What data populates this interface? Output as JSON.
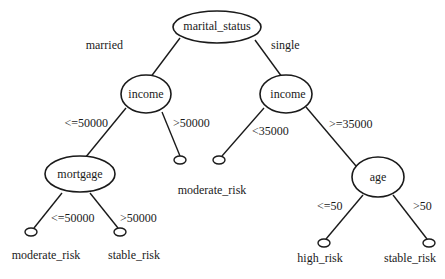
{
  "diagram": {
    "type": "decision-tree",
    "nodes": {
      "root": {
        "label": "marital_status"
      },
      "income_left": {
        "label": "income"
      },
      "income_right": {
        "label": "income"
      },
      "mortgage": {
        "label": "mortgage"
      },
      "age": {
        "label": "age"
      }
    },
    "edges": {
      "root_married": {
        "label": "married"
      },
      "root_single": {
        "label": "single"
      },
      "income_left_le50000": {
        "label": "<=50000"
      },
      "income_left_gt50000": {
        "label": ">50000"
      },
      "income_right_lt35000": {
        "label": "<35000"
      },
      "income_right_ge35000": {
        "label": ">=35000"
      },
      "mortgage_le50000": {
        "label": "<=50000"
      },
      "mortgage_gt50000": {
        "label": ">50000"
      },
      "age_le50": {
        "label": "<=50"
      },
      "age_gt50": {
        "label": ">50"
      }
    },
    "leaves": {
      "middle_shared": {
        "label": "moderate_risk"
      },
      "mortgage_le": {
        "label": "moderate_risk"
      },
      "mortgage_gt": {
        "label": "stable_risk"
      },
      "age_le": {
        "label": "high_risk"
      },
      "age_gt": {
        "label": "stable_risk"
      }
    }
  }
}
